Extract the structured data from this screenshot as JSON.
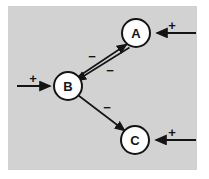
{
  "figure": {
    "panel": {
      "background_color": "#d2d2d2",
      "outer_background_color": "#ffffff"
    },
    "stroke_color": "#141414",
    "node_fill_color": "#ffffff"
  },
  "diagram_data": {
    "type": "diagram",
    "description": "signed interaction network",
    "nodes": [
      {
        "id": "A",
        "label": "A",
        "cx": 136,
        "cy": 33,
        "r": 14
      },
      {
        "id": "B",
        "label": "B",
        "cx": 68,
        "cy": 86,
        "r": 14
      },
      {
        "id": "C",
        "label": "C",
        "cx": 135,
        "cy": 140,
        "r": 14
      }
    ],
    "edges": [
      {
        "from": "B",
        "to": "A",
        "sign": "-",
        "label_x": 92,
        "label_y": 56
      },
      {
        "from": "A",
        "to": "B",
        "sign": "-",
        "label_x": 110,
        "label_y": 70
      },
      {
        "from": "B",
        "to": "C",
        "sign": "-",
        "label_x": 107,
        "label_y": 107
      }
    ],
    "external_inputs": [
      {
        "target": "A",
        "sign": "+",
        "side": "right",
        "label_x": 172,
        "label_y": 26
      },
      {
        "target": "B",
        "sign": "+",
        "side": "left",
        "label_x": 33,
        "label_y": 79
      },
      {
        "target": "C",
        "sign": "+",
        "side": "right",
        "label_x": 172,
        "label_y": 133
      }
    ]
  },
  "labels": {
    "node_a": "A",
    "node_b": "B",
    "node_c": "C",
    "minus_b_to_a": "−",
    "minus_a_to_b": "−",
    "minus_b_to_c": "−",
    "plus_into_a": "+",
    "plus_into_b": "+",
    "plus_into_c": "+"
  }
}
